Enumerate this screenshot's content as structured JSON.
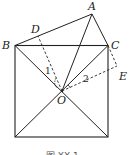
{
  "figure": {
    "points": {
      "A": {
        "label": "A",
        "x": 92,
        "y": 14
      },
      "B": {
        "label": "B",
        "x": 15,
        "y": 45
      },
      "C": {
        "label": "C",
        "x": 108,
        "y": 46
      },
      "D": {
        "label": "D",
        "x": 38,
        "y": 36
      },
      "E": {
        "label": "E",
        "x": 117,
        "y": 66
      },
      "O": {
        "label": "O",
        "x": 62,
        "y": 91
      },
      "BL": {
        "x": 15,
        "y": 137
      },
      "BR": {
        "x": 108,
        "y": 137
      }
    },
    "angle_labels": {
      "angle1": "1",
      "angle2": "2"
    },
    "caption": "图 XX-1",
    "colors": {
      "stroke": "#222222",
      "background": "#ffffff"
    }
  }
}
